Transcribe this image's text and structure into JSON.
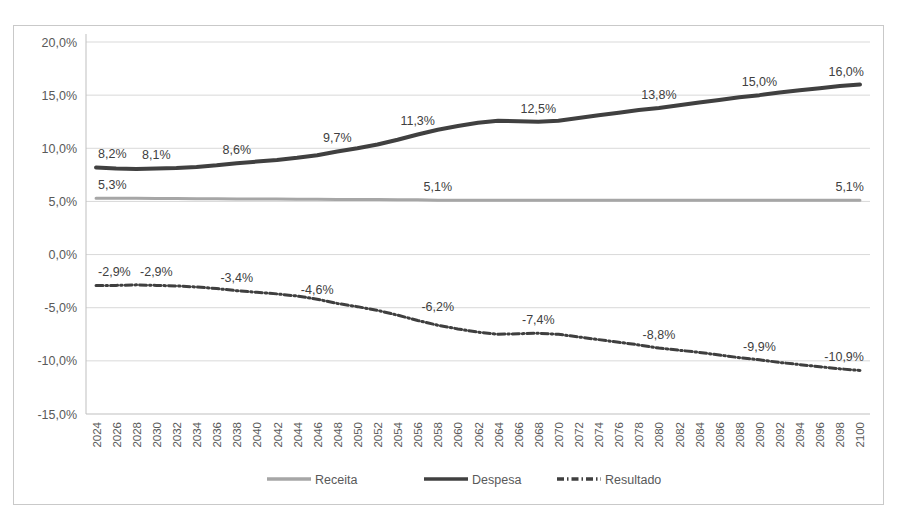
{
  "chart_data": {
    "type": "line",
    "title": "",
    "xlabel": "",
    "ylabel": "",
    "ylim": [
      -15,
      20
    ],
    "ytick_labels": [
      "20,0%",
      "15,0%",
      "10,0%",
      "5,0%",
      "0,0%",
      "-5,0%",
      "-10,0%",
      "-15,0%"
    ],
    "ytick_values": [
      20,
      15,
      10,
      5,
      0,
      -5,
      -10,
      -15
    ],
    "grid": true,
    "legend_position": "bottom",
    "decimal_separator": ",",
    "categories": [
      "2024",
      "2026",
      "2028",
      "2030",
      "2032",
      "2034",
      "2036",
      "2038",
      "2040",
      "2042",
      "2044",
      "2046",
      "2048",
      "2050",
      "2052",
      "2054",
      "2056",
      "2058",
      "2060",
      "2062",
      "2064",
      "2066",
      "2068",
      "2070",
      "2072",
      "2074",
      "2076",
      "2078",
      "2080",
      "2082",
      "2084",
      "2086",
      "2088",
      "2090",
      "2092",
      "2094",
      "2096",
      "2098",
      "2100"
    ],
    "series": [
      {
        "name": "Receita",
        "color": "#a6a6a6",
        "style": "solid",
        "width": 3,
        "values": [
          5.3,
          5.3,
          5.3,
          5.28,
          5.27,
          5.26,
          5.25,
          5.24,
          5.23,
          5.22,
          5.21,
          5.2,
          5.19,
          5.18,
          5.17,
          5.16,
          5.15,
          5.1,
          5.1,
          5.1,
          5.1,
          5.1,
          5.1,
          5.1,
          5.1,
          5.1,
          5.1,
          5.1,
          5.1,
          5.1,
          5.1,
          5.1,
          5.1,
          5.1,
          5.1,
          5.1,
          5.1,
          5.1,
          5.1
        ],
        "labels": [
          {
            "category": "2024",
            "value": 5.3,
            "text": "5,3%"
          },
          {
            "category": "2058",
            "value": 5.1,
            "text": "5,1%"
          },
          {
            "category": "2100",
            "value": 5.1,
            "text": "5,1%"
          }
        ]
      },
      {
        "name": "Despesa",
        "color": "#404040",
        "style": "solid",
        "width": 4,
        "values": [
          8.2,
          8.1,
          8.05,
          8.1,
          8.15,
          8.25,
          8.4,
          8.6,
          8.75,
          8.9,
          9.1,
          9.35,
          9.7,
          10.0,
          10.35,
          10.8,
          11.3,
          11.75,
          12.1,
          12.4,
          12.6,
          12.55,
          12.5,
          12.6,
          12.85,
          13.1,
          13.35,
          13.6,
          13.8,
          14.05,
          14.3,
          14.55,
          14.8,
          15.0,
          15.25,
          15.45,
          15.65,
          15.85,
          16.0
        ],
        "labels": [
          {
            "category": "2024",
            "value": 8.2,
            "text": "8,2%"
          },
          {
            "category": "2030",
            "value": 8.1,
            "text": "8,1%"
          },
          {
            "category": "2038",
            "value": 8.6,
            "text": "8,6%"
          },
          {
            "category": "2048",
            "value": 9.7,
            "text": "9,7%"
          },
          {
            "category": "2056",
            "value": 11.3,
            "text": "11,3%"
          },
          {
            "category": "2068",
            "value": 12.5,
            "text": "12,5%"
          },
          {
            "category": "2080",
            "value": 13.8,
            "text": "13,8%"
          },
          {
            "category": "2090",
            "value": 15.0,
            "text": "15,0%"
          },
          {
            "category": "2100",
            "value": 16.0,
            "text": "16,0%"
          }
        ]
      },
      {
        "name": "Resultado",
        "color": "#3f3f3f",
        "style": "dashdot",
        "width": 3,
        "values": [
          -2.9,
          -2.9,
          -2.85,
          -2.9,
          -2.95,
          -3.05,
          -3.2,
          -3.4,
          -3.55,
          -3.7,
          -3.9,
          -4.2,
          -4.6,
          -4.9,
          -5.25,
          -5.7,
          -6.2,
          -6.65,
          -7.0,
          -7.3,
          -7.5,
          -7.45,
          -7.4,
          -7.5,
          -7.75,
          -8.0,
          -8.25,
          -8.5,
          -8.8,
          -9.0,
          -9.2,
          -9.45,
          -9.7,
          -9.9,
          -10.15,
          -10.35,
          -10.55,
          -10.75,
          -10.9
        ],
        "labels": [
          {
            "category": "2024",
            "value": -2.9,
            "text": "-2,9%"
          },
          {
            "category": "2030",
            "value": -2.9,
            "text": "-2,9%"
          },
          {
            "category": "2038",
            "value": -3.4,
            "text": "-3,4%"
          },
          {
            "category": "2046",
            "value": -4.6,
            "text": "-4,6%"
          },
          {
            "category": "2058",
            "value": -6.2,
            "text": "-6,2%"
          },
          {
            "category": "2068",
            "value": -7.4,
            "text": "-7,4%"
          },
          {
            "category": "2080",
            "value": -8.8,
            "text": "-8,8%"
          },
          {
            "category": "2090",
            "value": -9.9,
            "text": "-9,9%"
          },
          {
            "category": "2100",
            "value": -10.9,
            "text": "-10,9%"
          }
        ]
      }
    ],
    "legend": [
      {
        "label": "Receita",
        "color": "#a6a6a6",
        "style": "solid"
      },
      {
        "label": "Despesa",
        "color": "#404040",
        "style": "solid"
      },
      {
        "label": "Resultado",
        "color": "#3f3f3f",
        "style": "dashdot"
      }
    ]
  }
}
